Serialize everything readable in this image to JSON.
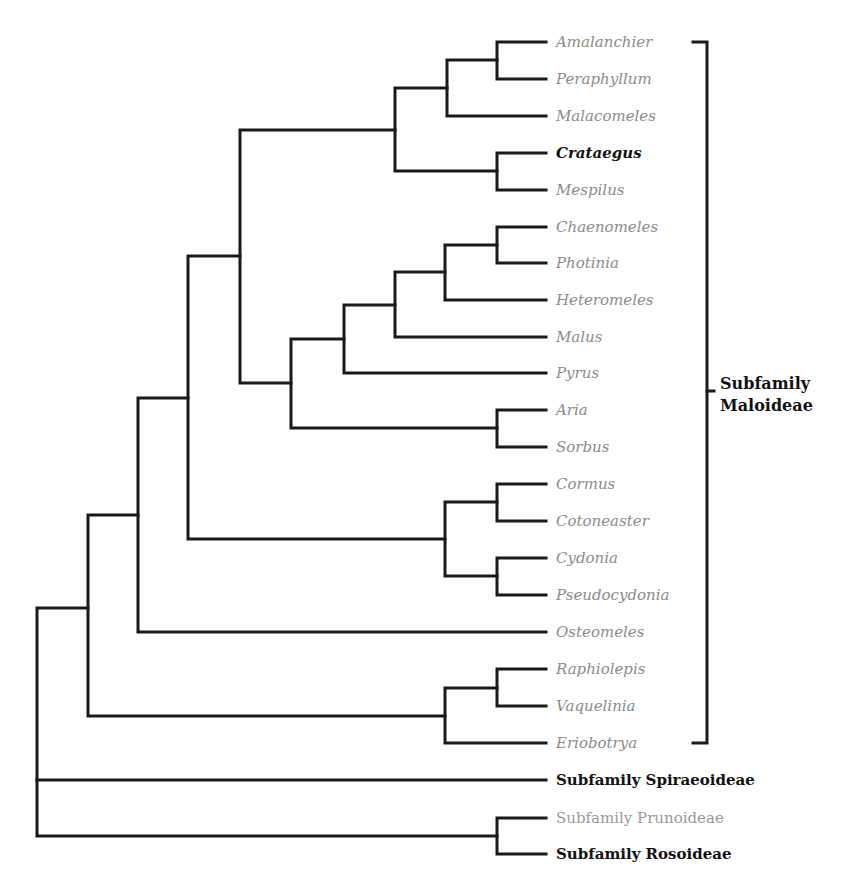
{
  "diagram": {
    "type": "phylogenetic-tree",
    "line_color": "#1a1a1a",
    "taxa": [
      {
        "label": "Amalanchier",
        "y": 42,
        "style": "italic-grey"
      },
      {
        "label": "Peraphyllum",
        "y": 79,
        "style": "italic-grey"
      },
      {
        "label": "Malacomeles",
        "y": 116,
        "style": "italic-grey"
      },
      {
        "label": "Crataegus",
        "y": 153,
        "style": "italic-bold"
      },
      {
        "label": "Mespilus",
        "y": 190,
        "style": "italic-grey"
      },
      {
        "label": "Chaenomeles",
        "y": 227,
        "style": "italic-grey"
      },
      {
        "label": "Photinia",
        "y": 263,
        "style": "italic-grey"
      },
      {
        "label": "Heteromeles",
        "y": 300,
        "style": "italic-grey"
      },
      {
        "label": "Malus",
        "y": 337,
        "style": "italic-grey"
      },
      {
        "label": "Pyrus",
        "y": 373,
        "style": "italic-grey"
      },
      {
        "label": "Aria",
        "y": 410,
        "style": "italic-grey"
      },
      {
        "label": "Sorbus",
        "y": 447,
        "style": "italic-grey"
      },
      {
        "label": "Cormus",
        "y": 484,
        "style": "italic-grey"
      },
      {
        "label": "Cotoneaster",
        "y": 521,
        "style": "italic-grey"
      },
      {
        "label": "Cydonia",
        "y": 558,
        "style": "italic-grey"
      },
      {
        "label": "Pseudocydonia",
        "y": 595,
        "style": "italic-grey"
      },
      {
        "label": "Osteomeles",
        "y": 632,
        "style": "italic-grey"
      },
      {
        "label": "Raphiolepis",
        "y": 669,
        "style": "italic-grey"
      },
      {
        "label": "Vaquelinia",
        "y": 706,
        "style": "italic-grey"
      },
      {
        "label": "Eriobotrya",
        "y": 743,
        "style": "italic-grey"
      }
    ],
    "subfamilies": [
      {
        "label": "Subfamily Spiraeoideae",
        "y": 780,
        "style": "bold"
      },
      {
        "label": "Subfamily Prunoideae",
        "y": 818,
        "style": "grey"
      },
      {
        "label": "Subfamily Rosoideae",
        "y": 854,
        "style": "bold"
      }
    ],
    "bracket": {
      "label_line1": "Subfamily",
      "label_line2": "Maloideae",
      "top_y": 42,
      "bottom_y": 743
    }
  }
}
